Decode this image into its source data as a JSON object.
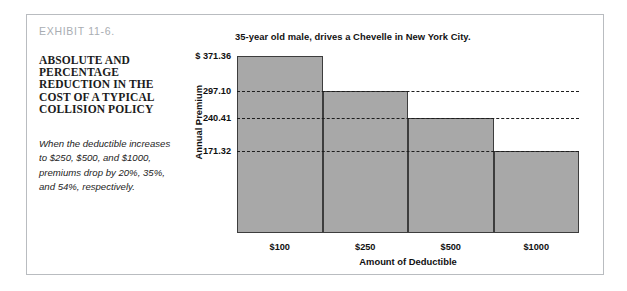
{
  "exhibit": {
    "number": "EXHIBIT 11-6.",
    "heading": "ABSOLUTE AND PERCENTAGE REDUCTION IN THE COST OF A TYPICAL COLLISION POLICY",
    "caption": "When the deductible increases to $250, $500, and $1000, premiums drop by 20%, 35%, and 54%, respectively."
  },
  "chart_data": {
    "type": "bar",
    "title": "35-year old male, drives a Chevelle in New York City.",
    "xlabel": "Amount of Deductible",
    "ylabel": "Annual Premium",
    "categories": [
      "$100",
      "$250",
      "$500",
      "$1000"
    ],
    "values": [
      371.36,
      297.1,
      240.41,
      171.32
    ],
    "value_labels": [
      "$ 371.36",
      "297.10",
      "240.41",
      "171.32"
    ],
    "ylim": [
      0,
      371.36
    ],
    "grid": true,
    "gridlines": [
      297.1,
      240.41,
      171.32
    ],
    "legend": "none",
    "bar_color": "#a8a8a8",
    "bar_border_color": "#3d3d3d",
    "axis_color": "#3b3b3b",
    "frame_color": "#b9bcc0",
    "exhibit_number_color": "#a9adb2"
  }
}
